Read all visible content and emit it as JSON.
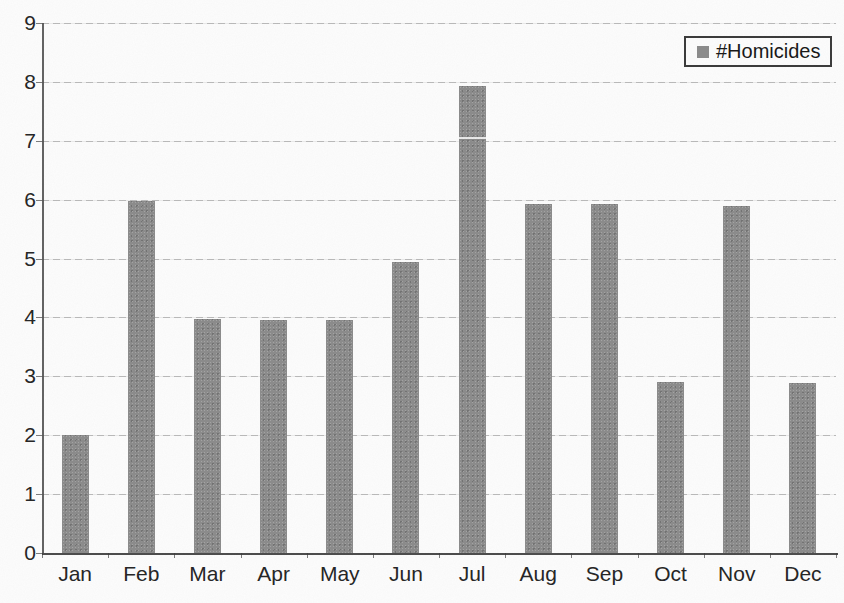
{
  "legend": {
    "label": "#Homicides"
  },
  "colors": {
    "bar": "#8b8b8b",
    "grid": "#c6c6c6",
    "axis": "#4b4b4b",
    "text": "#242424",
    "background": "#fdfdfd",
    "legend_border": "#3a3a3a"
  },
  "chart_data": {
    "type": "bar",
    "title": "",
    "xlabel": "",
    "ylabel": "",
    "categories": [
      "Jan",
      "Feb",
      "Mar",
      "Apr",
      "May",
      "Jun",
      "Jul",
      "Aug",
      "Sep",
      "Oct",
      "Nov",
      "Dec"
    ],
    "series": [
      {
        "name": "#Homicides",
        "values": [
          2,
          6,
          4,
          4,
          4,
          5,
          8,
          6,
          6,
          3,
          6,
          3
        ]
      }
    ],
    "rendered_values": [
      2.0,
      5.98,
      3.97,
      3.96,
      3.95,
      4.95,
      7.93,
      5.93,
      5.92,
      2.91,
      5.9,
      2.89
    ],
    "ylim": [
      0,
      9
    ],
    "yticks": [
      0,
      1,
      2,
      3,
      4,
      5,
      6,
      7,
      8,
      9
    ],
    "grid": "horizontal-major",
    "legend_position": "top-right",
    "legend_entries": [
      "#Homicides"
    ],
    "bar_color": "#8b8b8b",
    "scan_artifacts": [
      {
        "type": "white-gridline-over-bar",
        "category": "Jul",
        "value": 7.07
      }
    ]
  }
}
